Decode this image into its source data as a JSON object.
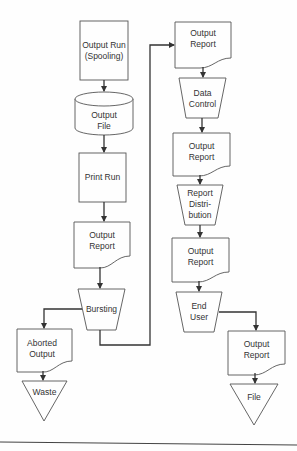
{
  "diagram": {
    "type": "flowchart",
    "nodes": {
      "output_run": {
        "label": "Output Run\n(Spooling)",
        "shape": "process"
      },
      "output_file": {
        "label": "Output\nFile",
        "shape": "stored-data"
      },
      "print_run": {
        "label": "Print Run",
        "shape": "process"
      },
      "output_report_1": {
        "label": "Output\nReport",
        "shape": "document"
      },
      "bursting": {
        "label": "Bursting",
        "shape": "manual-operation"
      },
      "aborted_output": {
        "label": "Aborted\nOutput",
        "shape": "document"
      },
      "waste": {
        "label": "Waste",
        "shape": "merge"
      },
      "output_report_2": {
        "label": "Output\nReport",
        "shape": "document"
      },
      "data_control": {
        "label": "Data\nControl",
        "shape": "manual-operation"
      },
      "output_report_3": {
        "label": "Output\nReport",
        "shape": "document"
      },
      "report_distribution": {
        "label": "Report\nDistri-\nbution",
        "shape": "manual-operation"
      },
      "output_report_4": {
        "label": "Output\nReport",
        "shape": "document"
      },
      "end_user": {
        "label": "End\nUser",
        "shape": "manual-operation"
      },
      "output_report_5": {
        "label": "Output\nReport",
        "shape": "document"
      },
      "file": {
        "label": "File",
        "shape": "merge"
      }
    },
    "edges": [
      [
        "output_run",
        "output_file"
      ],
      [
        "output_file",
        "print_run"
      ],
      [
        "print_run",
        "output_report_1"
      ],
      [
        "output_report_1",
        "bursting"
      ],
      [
        "bursting",
        "aborted_output"
      ],
      [
        "aborted_output",
        "waste"
      ],
      [
        "bursting",
        "output_report_2"
      ],
      [
        "output_report_2",
        "data_control"
      ],
      [
        "data_control",
        "output_report_3"
      ],
      [
        "output_report_3",
        "report_distribution"
      ],
      [
        "report_distribution",
        "output_report_4"
      ],
      [
        "output_report_4",
        "end_user"
      ],
      [
        "end_user",
        "output_report_5"
      ],
      [
        "output_report_5",
        "file"
      ]
    ]
  }
}
